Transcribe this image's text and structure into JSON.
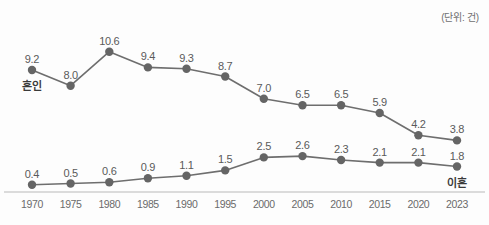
{
  "unit_note": "(단위: 건)",
  "chart_data": {
    "type": "line",
    "title": "",
    "subtitle": "",
    "xlabel": "",
    "ylabel": "",
    "unit": "(단위: 건)",
    "grid": false,
    "legend_position": "inline-endpoint",
    "categories": [
      "1970",
      "1975",
      "1980",
      "1985",
      "1990",
      "1995",
      "2000",
      "2005",
      "2010",
      "2015",
      "2020",
      "2023"
    ],
    "ylim": [
      0,
      11.5
    ],
    "series": [
      {
        "name": "혼인",
        "color": "#6e6e6e",
        "label_anchor": "start",
        "values": [
          9.2,
          8.0,
          10.6,
          9.4,
          9.3,
          8.7,
          7.0,
          6.5,
          6.5,
          5.9,
          4.2,
          3.8
        ],
        "value_labels": [
          "9.2",
          "8.0",
          "10.6",
          "9.4",
          "9.3",
          "8.7",
          "7.0",
          "6.5",
          "6.5",
          "5.9",
          "4.2",
          "3.8"
        ]
      },
      {
        "name": "이혼",
        "color": "#6e6e6e",
        "label_anchor": "end",
        "values": [
          0.4,
          0.5,
          0.6,
          0.9,
          1.1,
          1.5,
          2.5,
          2.6,
          2.3,
          2.1,
          2.1,
          1.8
        ],
        "value_labels": [
          "0.4",
          "0.5",
          "0.6",
          "0.9",
          "1.1",
          "1.5",
          "2.5",
          "2.6",
          "2.3",
          "2.1",
          "2.1",
          "1.8"
        ]
      }
    ]
  },
  "colors": {
    "line": "#6e6e6e",
    "marker": "#656565",
    "axis": "#b9b9b9",
    "text": "#5a5a5a",
    "background": "#fdfdfd"
  }
}
